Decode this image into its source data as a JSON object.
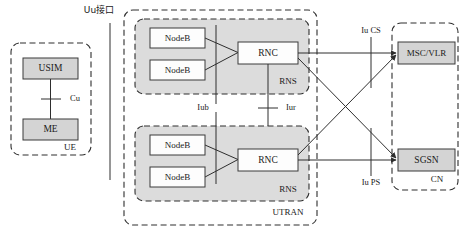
{
  "figure": {
    "colors": {
      "shaded_fill": "#dcdcdc",
      "solid_box_fill": "#d4d4d4",
      "white_box_fill": "#fdfdfd",
      "line": "#2e2e2e",
      "background": "#ffffff"
    }
  },
  "ue": {
    "region_label": "UE",
    "usim_label": "USIM",
    "me_label": "ME",
    "cu_label": "Cu"
  },
  "uu": {
    "interface_label": "Uu接口"
  },
  "utran": {
    "region_label": "UTRAN",
    "iub_label": "Iub",
    "iur_label": "Iur",
    "rns_top": {
      "label": "RNS",
      "nodeb_1": "NodeB",
      "nodeb_2": "NodeB",
      "rnc": "RNC"
    },
    "rns_bottom": {
      "label": "RNS",
      "nodeb_1": "NodeB",
      "nodeb_2": "NodeB",
      "rnc": "RNC"
    }
  },
  "cn": {
    "region_label": "CN",
    "msc_vlr": "MSC/VLR",
    "sgsn": "SGSN",
    "iu_cs_label": "Iu CS",
    "iu_ps_label": "Iu PS"
  }
}
